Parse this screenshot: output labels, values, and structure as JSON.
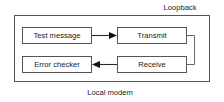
{
  "diagram": {
    "type": "block-diagram",
    "outer_container": {
      "name": "local-modem-boundary",
      "label": "Local modem",
      "label_position": "below-center",
      "bounds": {
        "x": 14,
        "y": 15,
        "width": 196,
        "height": 67
      }
    },
    "labels": [
      {
        "id": "loopback",
        "text": "Loopback",
        "x": 180,
        "y": 8,
        "position": "above-right"
      },
      {
        "id": "local-modem",
        "text": "Local modem",
        "x": 110,
        "y": 93,
        "position": "below-center"
      }
    ],
    "nodes": [
      {
        "id": "test-message",
        "label": "Test message",
        "x": 22,
        "y": 27,
        "width": 70,
        "height": 17
      },
      {
        "id": "transmit",
        "label": "Transmit",
        "x": 117,
        "y": 27,
        "width": 70,
        "height": 17
      },
      {
        "id": "error-checker",
        "label": "Error checker",
        "x": 22,
        "y": 56,
        "width": 70,
        "height": 17
      },
      {
        "id": "receive",
        "label": "Receive",
        "x": 117,
        "y": 56,
        "width": 70,
        "height": 17
      }
    ],
    "edges": [
      {
        "id": "test-message-to-transmit",
        "from": "test-message",
        "to": "transmit",
        "direction": "right",
        "arrow": true
      },
      {
        "id": "receive-to-error-checker",
        "from": "receive",
        "to": "error-checker",
        "direction": "left",
        "arrow": true
      },
      {
        "id": "loopback-path",
        "from": "transmit",
        "to": "receive",
        "direction": "wrap-right",
        "arrow": false
      }
    ],
    "colors": {
      "background": "#ffffff",
      "box_stroke": "#555555",
      "arrow": "#111111",
      "loop_stroke": "#666666",
      "text": "#1a1a1a"
    }
  }
}
